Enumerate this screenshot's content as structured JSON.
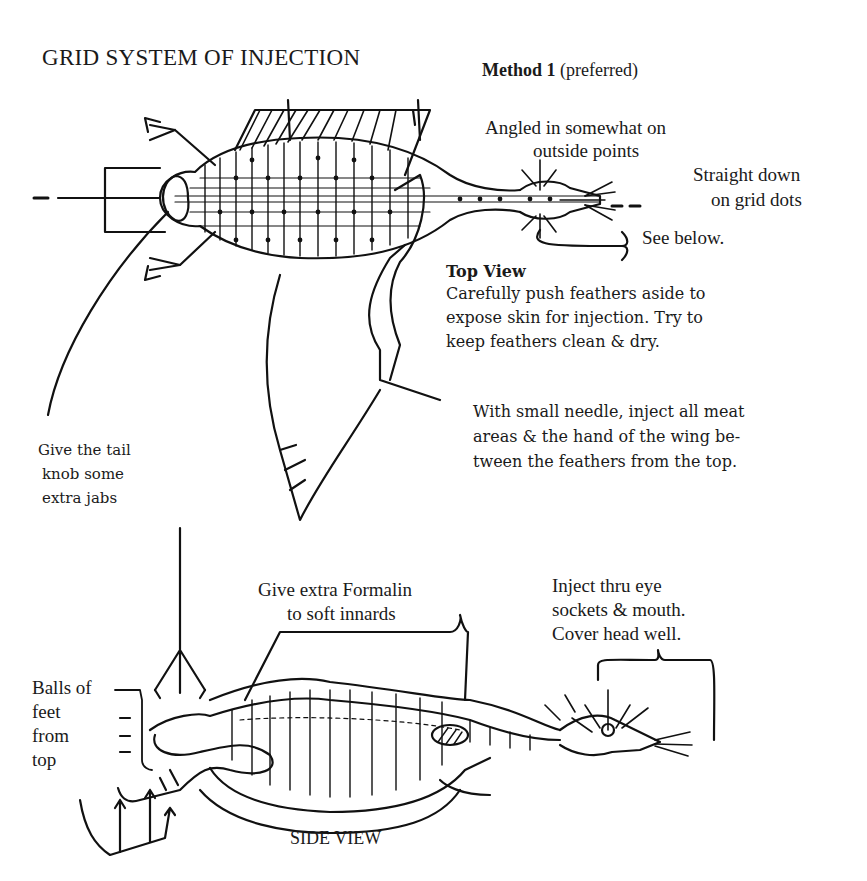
{
  "title": "GRID SYSTEM OF INJECTION",
  "method": {
    "bold": "Method 1",
    "note": " (preferred)"
  },
  "top_view": {
    "angled_label": [
      "Angled in somewhat on",
      "outside points"
    ],
    "straight_label": [
      "Straight down",
      "on grid dots"
    ],
    "see_below": "See below.",
    "heading": "Top View",
    "push_text": [
      "Carefully push feathers aside to",
      "expose skin for injection. Try to",
      "keep feathers clean & dry."
    ],
    "needle_text": [
      "With small needle, inject all meat",
      "areas & the hand of the wing be-",
      "tween the feathers from the top."
    ],
    "tail_text": [
      "Give the tail",
      "knob some",
      "extra jabs"
    ]
  },
  "side_view": {
    "formalin_text": [
      "Give extra Formalin",
      "to soft innards"
    ],
    "eye_text": [
      "Inject thru eye",
      "sockets & mouth.",
      "Cover head well."
    ],
    "feet_text": [
      "Balls of",
      "feet",
      "from",
      "top"
    ],
    "heading": "SIDE VIEW"
  }
}
